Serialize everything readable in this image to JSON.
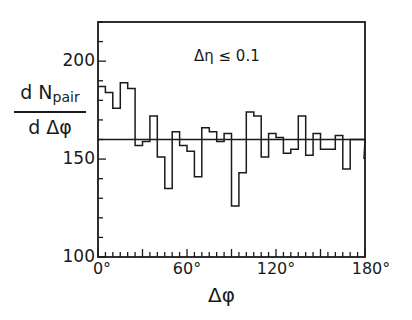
{
  "chart_data": {
    "type": "bar",
    "subtype": "step-histogram",
    "title": "",
    "xlabel": "Δφ",
    "ylabel_numerator": "d N",
    "ylabel_subscript": "pair",
    "ylabel_denominator": "d Δφ",
    "annotation": "Δη ≤ 0.1",
    "xlim": [
      0,
      180
    ],
    "ylim": [
      100,
      220
    ],
    "x_tick_labels": [
      "0°",
      "60°",
      "120°",
      "180°"
    ],
    "x_ticks": [
      0,
      60,
      120,
      180
    ],
    "x_minor_tick_step": 5,
    "y_tick_labels": [
      "100",
      "150",
      "200"
    ],
    "y_ticks": [
      100,
      150,
      200
    ],
    "y_minor_tick_step": 10,
    "bin_width": 5,
    "bin_edges_start": 0,
    "values": [
      187,
      184,
      176,
      189,
      186,
      157,
      159,
      172,
      151,
      135,
      164,
      157,
      154,
      141,
      166,
      164,
      159,
      163,
      126,
      143,
      174,
      172,
      151,
      163,
      161,
      153,
      155,
      172,
      152,
      163,
      155,
      155,
      162,
      145,
      160,
      160
    ],
    "end_drop_value": 150,
    "reference_line": 160,
    "grid": false,
    "legend": null
  }
}
